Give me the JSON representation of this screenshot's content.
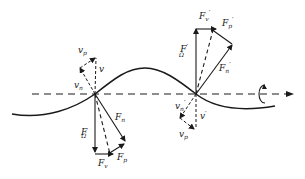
{
  "diagram": {
    "colors": {
      "ink": "#1a1a1a",
      "background": "#ffffff"
    },
    "axis": {
      "label": "",
      "style": "dashed",
      "direction": "right"
    },
    "curve": {
      "type": "sine-wave",
      "description": "wave crossing axis at two nodes"
    },
    "rotation_symbol": "rotation-about-axis",
    "nodes": [
      {
        "id": "left-node",
        "velocity_labels": {
          "v": "v",
          "v_n": "v",
          "v_n_sub": "n",
          "v_p": "v",
          "v_p_sub": "p"
        },
        "force_labels": {
          "F_n": "F",
          "F_n_sub": "n",
          "F_omega": "F",
          "F_omega_sub": "Ω",
          "F_v": "F",
          "F_v_sub": "v",
          "F_p": "F",
          "F_p_sub": "p"
        }
      },
      {
        "id": "right-node",
        "velocity_labels": {
          "v": "v",
          "v_n": "v",
          "v_n_sub": "n",
          "v_p": "v",
          "v_p_sub": "p"
        },
        "force_labels": {
          "F_n": "F",
          "F_n_sub": "n",
          "F_omega": "F",
          "F_omega_sub": "Ω",
          "F_v": "F",
          "F_v_sub": "v",
          "F_p": "F",
          "F_p_sub": "p"
        },
        "prime": "′"
      }
    ]
  }
}
